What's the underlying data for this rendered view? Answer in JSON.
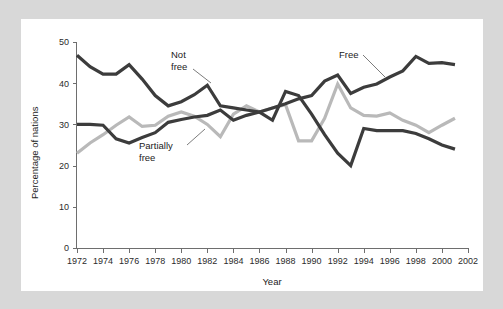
{
  "chart_data": {
    "type": "line",
    "title": "",
    "subtitle": "",
    "xlabel": "Year",
    "ylabel": "Percentage of nations",
    "xlim": [
      1972,
      2002
    ],
    "ylim": [
      0,
      50
    ],
    "xticks": [
      1972,
      1974,
      1976,
      1978,
      1980,
      1982,
      1984,
      1986,
      1988,
      1990,
      1992,
      1994,
      1996,
      1998,
      2000,
      2002
    ],
    "yticks": [
      0,
      10,
      20,
      30,
      40,
      50
    ],
    "xtick_labels": [
      "1972",
      "1974",
      "1976",
      "1978",
      "1980",
      "1982",
      "1984",
      "1986",
      "1988",
      "1990",
      "1992",
      "1994",
      "1996",
      "1998",
      "2000",
      "2002"
    ],
    "ytick_labels": [
      "0",
      "10",
      "20",
      "30",
      "40",
      "50"
    ],
    "grid": false,
    "legend": "inline-annotations",
    "x": [
      1972,
      1973,
      1974,
      1975,
      1976,
      1977,
      1978,
      1979,
      1980,
      1981,
      1982,
      1983,
      1984,
      1985,
      1986,
      1987,
      1988,
      1989,
      1990,
      1991,
      1992,
      1993,
      1994,
      1995,
      1996,
      1997,
      1998,
      1999,
      2000,
      2001
    ],
    "series": [
      {
        "name": "Not free",
        "color": "#3c3c3c",
        "values": [
          46.8,
          44.0,
          42.2,
          42.2,
          44.5,
          41.0,
          37.0,
          34.5,
          35.5,
          37.2,
          39.5,
          34.5,
          34.0,
          33.5,
          33.0,
          31.0,
          38.0,
          37.0,
          32.5,
          27.5,
          23.0,
          20.0,
          29.0,
          28.5,
          28.5,
          28.5,
          27.8,
          26.5,
          25.0,
          24.0
        ]
      },
      {
        "name": "Partially free",
        "color": "#b9b9b9",
        "values": [
          23.0,
          25.5,
          27.5,
          29.8,
          31.8,
          29.5,
          29.8,
          32.0,
          33.0,
          32.0,
          30.0,
          27.0,
          32.5,
          34.5,
          33.0,
          34.0,
          34.8,
          26.0,
          26.0,
          31.5,
          39.8,
          34.0,
          32.2,
          32.0,
          32.8,
          31.0,
          29.8,
          28.0,
          29.8,
          31.5
        ]
      },
      {
        "name": "Free",
        "color": "#3c3c3c",
        "values": [
          30.0,
          30.0,
          29.8,
          26.5,
          25.5,
          26.8,
          28.0,
          30.5,
          31.2,
          31.8,
          32.2,
          33.5,
          31.0,
          32.2,
          33.0,
          34.0,
          35.0,
          36.2,
          37.0,
          40.5,
          42.0,
          37.5,
          39.0,
          39.8,
          41.5,
          43.0,
          46.5,
          44.8,
          45.0,
          44.5
        ]
      }
    ],
    "annotations": [
      {
        "name": "not-free",
        "text_line1": "Not",
        "text_line2": "free"
      },
      {
        "name": "partially-free",
        "text_line1": "Partially",
        "text_line2": "free"
      },
      {
        "name": "free",
        "text_line1": "Free",
        "text_line2": ""
      }
    ]
  },
  "colors": {
    "page_background": "#d8d8d8",
    "figure_background": "#ffffff",
    "dark_line": "#3c3c3c",
    "light_line": "#b9b9b9",
    "axis": "#6e6e6e",
    "text": "#1c1c1c"
  }
}
